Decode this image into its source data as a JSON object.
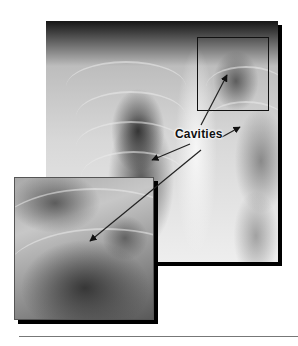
{
  "figure": {
    "annotation_label": "Cavities",
    "arrows": [
      {
        "target": "upper-right inset box (left upper lobe)"
      },
      {
        "target": "right lower lung zone"
      },
      {
        "target": "left mid lung zone"
      },
      {
        "target": "magnified inset cavity"
      }
    ],
    "inset_box_present": true,
    "magnified_inset_present": true
  },
  "colors": {
    "background": "#ffffff",
    "shadow": "#000000",
    "rule": "#777777",
    "label": "#111111"
  }
}
